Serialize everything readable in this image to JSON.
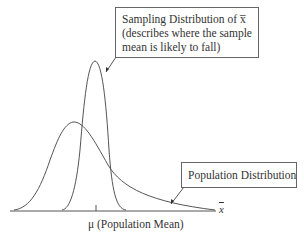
{
  "diagram": {
    "callouts": {
      "sampling": {
        "line1": "Sampling Distribution of x̅",
        "line2": "(describes where the sample",
        "line3": "mean is likely to fall)"
      },
      "population": {
        "label": "Population Distribution"
      }
    },
    "axis": {
      "variable_label": "x",
      "mean_label": "μ (Population Mean)"
    },
    "colors": {
      "curve": "#555555",
      "box_border": "#666666",
      "text": "#333333"
    }
  }
}
